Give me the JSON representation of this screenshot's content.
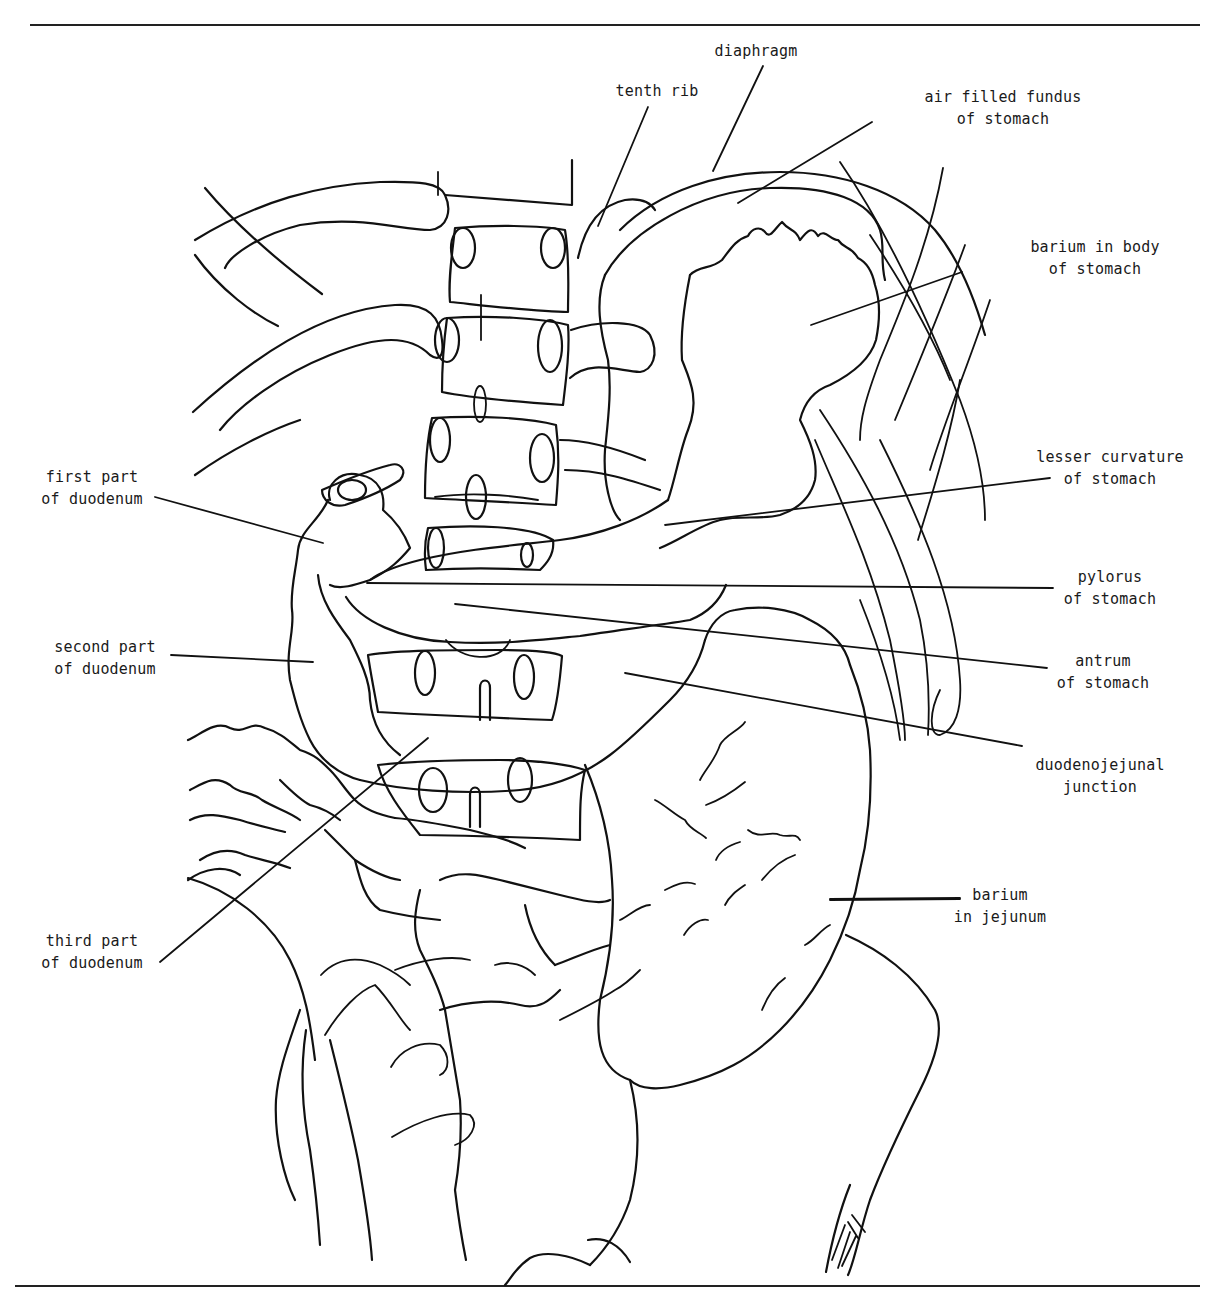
{
  "figure": {
    "ink_color": "#111111",
    "background": "#ffffff",
    "signature": "MF"
  },
  "labels": [
    {
      "id": "diaphragm",
      "lines": [
        "diaphragm"
      ],
      "x": 756,
      "y": 40,
      "align": "center",
      "leader": [
        [
          763,
          66
        ],
        [
          713,
          171
        ]
      ]
    },
    {
      "id": "tenth-rib",
      "lines": [
        "tenth rib"
      ],
      "x": 657,
      "y": 80,
      "align": "center",
      "leader": [
        [
          648,
          107
        ],
        [
          598,
          226
        ]
      ]
    },
    {
      "id": "air-filled-fundus",
      "lines": [
        "air filled fundus",
        "of stomach"
      ],
      "x": 1003,
      "y": 86,
      "align": "center",
      "leader": [
        [
          872,
          122
        ],
        [
          738,
          203
        ]
      ]
    },
    {
      "id": "barium-body",
      "lines": [
        "barium in body",
        "of stomach"
      ],
      "x": 1095,
      "y": 236,
      "align": "center",
      "leader": [
        [
          962,
          272
        ],
        [
          811,
          325
        ]
      ]
    },
    {
      "id": "lesser-curvature",
      "lines": [
        "lesser curvature",
        "of stomach"
      ],
      "x": 1110,
      "y": 446,
      "align": "center",
      "leader": [
        [
          1050,
          478
        ],
        [
          665,
          525
        ]
      ]
    },
    {
      "id": "pylorus",
      "lines": [
        "pylorus",
        "of stomach"
      ],
      "x": 1110,
      "y": 566,
      "align": "center",
      "leader": [
        [
          1053,
          588
        ],
        [
          367,
          583
        ]
      ]
    },
    {
      "id": "antrum",
      "lines": [
        "antrum",
        "of stomach"
      ],
      "x": 1103,
      "y": 650,
      "align": "center",
      "leader": [
        [
          1047,
          668
        ],
        [
          455,
          604
        ]
      ]
    },
    {
      "id": "duodenojejunal-junction",
      "lines": [
        "duodenojejunal",
        "junction"
      ],
      "x": 1100,
      "y": 754,
      "align": "center",
      "leader": [
        [
          1022,
          746
        ],
        [
          625,
          673
        ]
      ]
    },
    {
      "id": "first-part-duodenum",
      "lines": [
        "first part",
        "of duodenum"
      ],
      "x": 92,
      "y": 466,
      "align": "center",
      "leader": [
        [
          155,
          497
        ],
        [
          323,
          543
        ]
      ]
    },
    {
      "id": "second-part-duodenum",
      "lines": [
        "second part",
        "of duodenum"
      ],
      "x": 105,
      "y": 636,
      "align": "center",
      "leader": [
        [
          171,
          655
        ],
        [
          313,
          662
        ]
      ]
    },
    {
      "id": "third-part-duodenum",
      "lines": [
        "third part",
        "of duodenum"
      ],
      "x": 92,
      "y": 930,
      "align": "center",
      "leader": [
        [
          160,
          962
        ],
        [
          428,
          738
        ]
      ]
    },
    {
      "id": "barium-jejunum",
      "lines": [
        "barium",
        "in jejunum"
      ],
      "x": 1000,
      "y": 884,
      "align": "center",
      "leader": [
        [
          960,
          898
        ],
        [
          830,
          899
        ]
      ]
    }
  ],
  "rules": {
    "top": {
      "x1": 30,
      "x2": 1200,
      "y": 25
    },
    "bottom": {
      "x1": 15,
      "x2": 1200,
      "y": 1286
    }
  }
}
